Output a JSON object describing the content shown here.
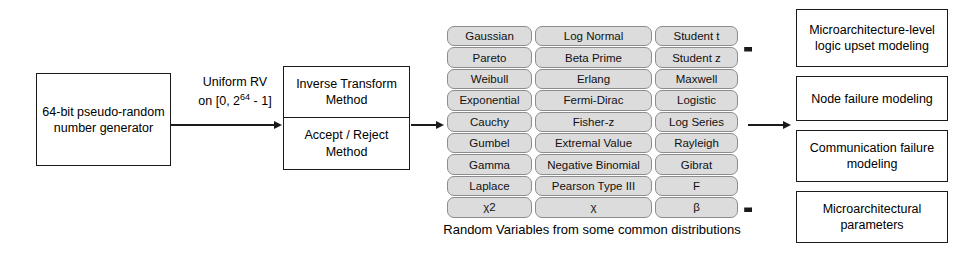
{
  "source": {
    "label": "64-bit pseudo-random number generator"
  },
  "uniform_arrow": {
    "line1": "Uniform RV",
    "line2_prefix": "on [0, 2",
    "line2_exponent": "64",
    "line2_suffix": " - 1]"
  },
  "methods": {
    "items": [
      {
        "label": "Inverse Transform Method"
      },
      {
        "label": "Accept / Reject Method"
      }
    ]
  },
  "distributions": {
    "caption": "Random Variables from some common distributions",
    "brace_glyph": "}",
    "columns": 3,
    "rows": [
      [
        "Gaussian",
        "Log Normal",
        "Student t"
      ],
      [
        "Pareto",
        "Beta Prime",
        "Student z"
      ],
      [
        "Weibull",
        "Erlang",
        "Maxwell"
      ],
      [
        "Exponential",
        "Fermi-Dirac",
        "Logistic"
      ],
      [
        "Cauchy",
        "Fisher-z",
        "Log Series"
      ],
      [
        "Gumbel",
        "Extremal Value",
        "Rayleigh"
      ],
      [
        "Gamma",
        "Negative Binomial",
        "Gibrat"
      ],
      [
        "Laplace",
        "Pearson Type III",
        "F"
      ],
      [
        "χ2",
        "χ",
        "β"
      ]
    ]
  },
  "outputs": {
    "items": [
      {
        "label": "Microarchitecture-level logic upset modeling"
      },
      {
        "label": "Node failure modeling"
      },
      {
        "label": "Communication failure modeling"
      },
      {
        "label": "Microarchitectural parameters"
      }
    ]
  },
  "colors": {
    "stroke": "#1a1a1a",
    "cell_fill": "#dcdcdc",
    "cell_border": "#8c8c8c",
    "background": "#ffffff"
  }
}
